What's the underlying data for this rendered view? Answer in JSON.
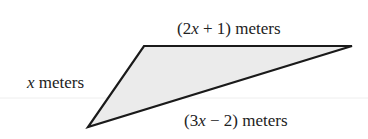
{
  "diagram": {
    "shape": "triangle",
    "fill_color": "#ebebeb",
    "stroke_color": "#1a1a1a",
    "guide_line_color": "#e6e6e6",
    "vertices": {
      "top_left": [
        144,
        46
      ],
      "top_right": [
        352,
        46
      ],
      "bottom": [
        88,
        127
      ]
    },
    "sides": {
      "top": {
        "prefix": "(2",
        "variable": "x",
        "suffix": " + 1) meters"
      },
      "left": {
        "variable": "x",
        "suffix": " meters"
      },
      "bottom": {
        "prefix": "(3",
        "variable": "x",
        "suffix": " − 2) meters"
      }
    }
  }
}
